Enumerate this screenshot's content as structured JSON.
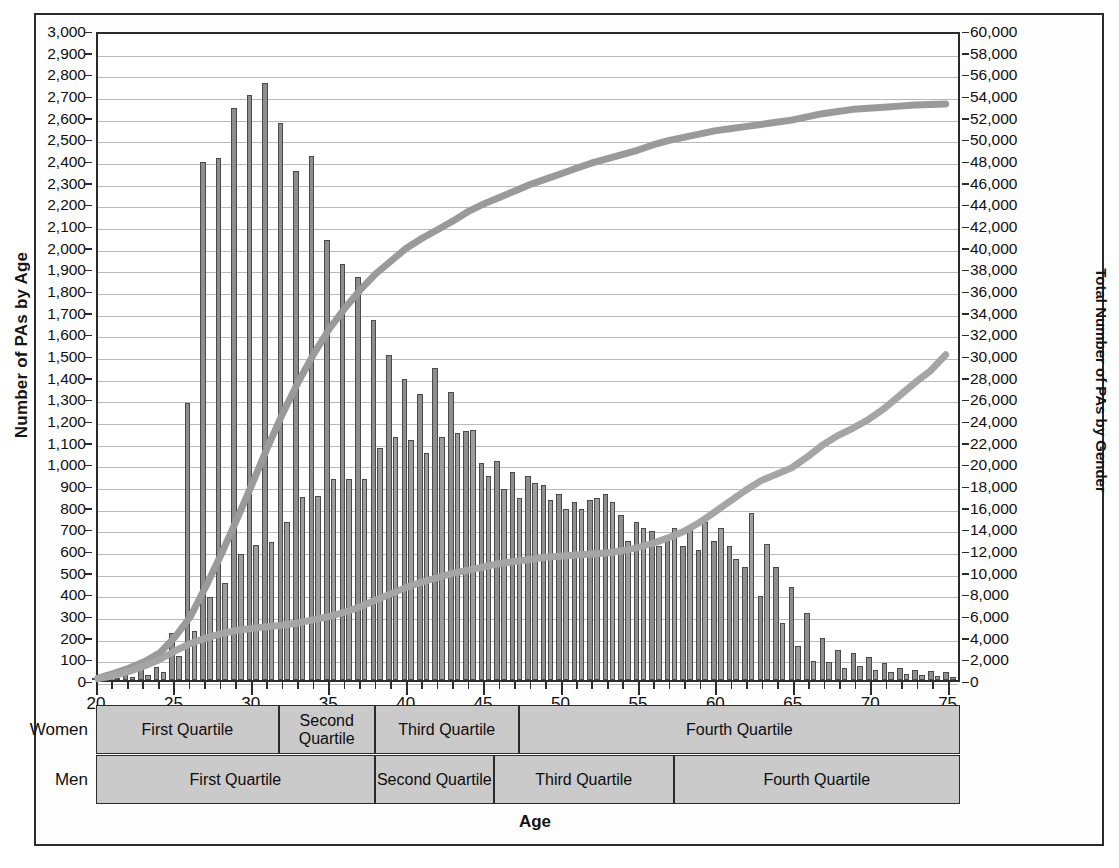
{
  "axes": {
    "left_title": "Number of PAs by Age",
    "right_title": "Total Number of PAs by Gender",
    "x_title": "Age",
    "left_ticks": [
      "3,000",
      "2,900",
      "2,800",
      "2,700",
      "2,600",
      "2,500",
      "2,400",
      "2,300",
      "2,200",
      "2,100",
      "2,000",
      "1,900",
      "1,800",
      "1,700",
      "1,600",
      "1,500",
      "1,400",
      "1,300",
      "1,200",
      "1,100",
      "1,000",
      "900",
      "800",
      "700",
      "600",
      "500",
      "400",
      "300",
      "200",
      "100",
      "0"
    ],
    "right_ticks": [
      "60,000",
      "58,000",
      "56,000",
      "54,000",
      "52,000",
      "50,000",
      "48,000",
      "46,000",
      "44,000",
      "42,000",
      "40,000",
      "38,000",
      "36,000",
      "34,000",
      "32,000",
      "30,000",
      "28,000",
      "26,000",
      "24,000",
      "22,000",
      "20,000",
      "18,000",
      "16,000",
      "14,000",
      "12,000",
      "10,000",
      "8,000",
      "6,000",
      "4,000",
      "2,000",
      "0"
    ],
    "x_ticks": [
      "20",
      "25",
      "30",
      "35",
      "40",
      "45",
      "50",
      "55",
      "60",
      "65",
      "70",
      "75"
    ]
  },
  "quartiles": {
    "women_label": "Women",
    "men_label": "Men",
    "women": [
      {
        "label": "First Quartile",
        "start_age": 20,
        "end_age": 31.8
      },
      {
        "label": "Second Quartile",
        "start_age": 31.8,
        "end_age": 38.0
      },
      {
        "label": "Third Quartile",
        "start_age": 38.0,
        "end_age": 47.3
      },
      {
        "label": "Fourth Quartile",
        "start_age": 47.3,
        "end_age": 75.8
      }
    ],
    "men": [
      {
        "label": "First Quartile",
        "start_age": 20,
        "end_age": 38.0
      },
      {
        "label": "Second Quartile",
        "start_age": 38.0,
        "end_age": 45.7
      },
      {
        "label": "Third Quartile",
        "start_age": 45.7,
        "end_age": 57.3
      },
      {
        "label": "Fourth Quartile",
        "start_age": 57.3,
        "end_age": 75.8
      }
    ]
  },
  "chart_data": {
    "type": "bar",
    "title": "",
    "xlabel": "Age",
    "ylabel": "Number of PAs by Age",
    "y2label": "Total Number of PAs by Gender",
    "xlim": [
      20,
      75.8
    ],
    "ylim": [
      0,
      3000
    ],
    "y2lim": [
      0,
      60000
    ],
    "grid": true,
    "legend_position": "none",
    "ages": [
      20,
      21,
      22,
      23,
      24,
      25,
      26,
      27,
      28,
      29,
      30,
      31,
      32,
      33,
      34,
      35,
      36,
      37,
      38,
      39,
      40,
      41,
      42,
      43,
      44,
      45,
      46,
      47,
      48,
      49,
      50,
      51,
      52,
      53,
      54,
      55,
      56,
      57,
      58,
      59,
      60,
      61,
      62,
      63,
      64,
      65,
      66,
      67,
      68,
      69,
      70,
      71,
      72,
      73,
      74,
      75
    ],
    "series": [
      {
        "name": "Women (bars)",
        "type": "bar",
        "axis": "left",
        "values": [
          10,
          20,
          30,
          55,
          60,
          215,
          1280,
          2390,
          2410,
          2640,
          2700,
          2755,
          2570,
          2350,
          2420,
          2030,
          1920,
          1860,
          1660,
          1500,
          1390,
          1320,
          1440,
          1330,
          1150,
          1000,
          1010,
          960,
          940,
          900,
          860,
          820,
          830,
          860,
          760,
          730,
          690,
          640,
          620,
          600,
          640,
          620,
          520,
          390,
          520,
          430,
          310,
          195,
          140,
          125,
          105,
          80,
          55,
          45,
          40,
          35
        ]
      },
      {
        "name": "Men (bars)",
        "type": "bar",
        "axis": "left",
        "values": [
          5,
          10,
          15,
          25,
          35,
          110,
          225,
          385,
          450,
          580,
          625,
          635,
          730,
          845,
          850,
          930,
          930,
          930,
          1070,
          1120,
          1110,
          1050,
          1120,
          1140,
          1155,
          940,
          880,
          840,
          910,
          830,
          790,
          790,
          840,
          820,
          640,
          700,
          620,
          700,
          710,
          730,
          700,
          560,
          770,
          630,
          265,
          155,
          90,
          85,
          55,
          65,
          45,
          35,
          30,
          25,
          20,
          15
        ]
      },
      {
        "name": "Women (cumulative)",
        "type": "line",
        "axis": "right",
        "values": [
          180,
          600,
          1100,
          1700,
          2500,
          4000,
          5900,
          8700,
          11700,
          14900,
          18200,
          21600,
          24800,
          27700,
          30300,
          32600,
          34500,
          36200,
          37700,
          38900,
          40100,
          41000,
          41800,
          42600,
          43500,
          44200,
          44800,
          45400,
          46000,
          46500,
          47000,
          47500,
          48000,
          48400,
          48800,
          49200,
          49700,
          50100,
          50400,
          50700,
          51000,
          51200,
          51400,
          51600,
          51800,
          52000,
          52300,
          52600,
          52800,
          53000,
          53100,
          53200,
          53300,
          53400,
          53450,
          53500
        ]
      },
      {
        "name": "Men (cumulative)",
        "type": "line",
        "axis": "right",
        "values": [
          120,
          400,
          800,
          1300,
          1900,
          2700,
          3400,
          3900,
          4300,
          4600,
          4800,
          4950,
          5100,
          5300,
          5600,
          5900,
          6300,
          6800,
          7400,
          8000,
          8600,
          9100,
          9500,
          9900,
          10200,
          10500,
          10800,
          11000,
          11200,
          11400,
          11500,
          11600,
          11700,
          11800,
          12000,
          12300,
          12700,
          13200,
          13800,
          14600,
          15600,
          16600,
          17600,
          18500,
          19100,
          19700,
          20700,
          21800,
          22700,
          23400,
          24200,
          25200,
          26400,
          27600,
          28700,
          30200
        ]
      }
    ]
  }
}
